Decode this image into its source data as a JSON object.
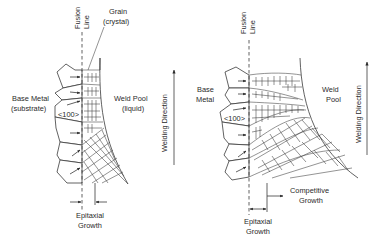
{
  "figure": {
    "panels": [
      {
        "id": "left",
        "title_hidden": "Epitaxial growth",
        "labels": {
          "fusion_line": [
            "Fusion",
            "Line"
          ],
          "grain": [
            "Grain",
            "(crystal)"
          ],
          "base_metal": [
            "Base Metal",
            "(substrate)"
          ],
          "direction": "<100>",
          "weld_pool": [
            "Weld Pool",
            "(liquid)"
          ],
          "welding_direction": "Welding Direction",
          "epitaxial_growth": [
            "Epitaxial",
            "Growth"
          ]
        }
      },
      {
        "id": "right",
        "title_hidden": "Competitive growth",
        "labels": {
          "fusion_line": [
            "Fusion",
            "Line"
          ],
          "base_metal": [
            "Base",
            "Metal"
          ],
          "direction": "<100>",
          "weld_pool": [
            "Weld",
            "Pool"
          ],
          "welding_direction": "Welding Direction",
          "competitive_growth": [
            "Competitive",
            "Growth"
          ],
          "epitaxial_growth": [
            "Epitaxial",
            "Growth"
          ]
        }
      }
    ],
    "colors": {
      "line": "#3a3a3a",
      "text": "#2a2a2a",
      "background": "#ffffff"
    }
  }
}
